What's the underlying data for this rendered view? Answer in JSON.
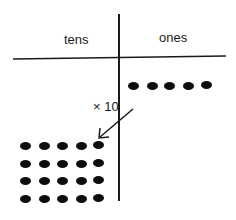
{
  "diagram": {
    "headers": {
      "tens": "tens",
      "ones": "ones"
    },
    "multiplier_label": "× 10",
    "colors": {
      "ink": "#1a1a1a",
      "dot": "#0d0d0d",
      "background": "#ffffff"
    },
    "ones_column": {
      "dot_count": 5,
      "rows": 1,
      "cols": 5
    },
    "tens_column": {
      "dot_count": 20,
      "rows": 4,
      "cols": 5
    },
    "arrow": {
      "from": "ones",
      "to": "tens",
      "meaning": "multiply by 10"
    }
  }
}
